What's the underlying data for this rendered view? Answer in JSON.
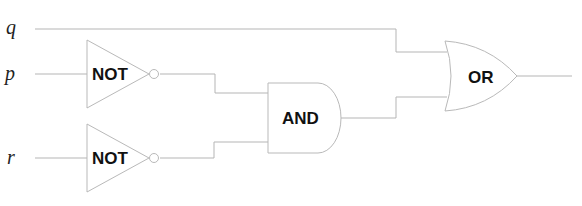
{
  "diagram": {
    "type": "logic-circuit",
    "inputs": [
      {
        "id": "q",
        "label": "q"
      },
      {
        "id": "p",
        "label": "p"
      },
      {
        "id": "r",
        "label": "r"
      }
    ],
    "gates": [
      {
        "id": "not1",
        "label": "NOT",
        "input": "p"
      },
      {
        "id": "not2",
        "label": "NOT",
        "input": "r"
      },
      {
        "id": "and1",
        "label": "AND",
        "inputs": [
          "not1",
          "not2"
        ]
      },
      {
        "id": "or1",
        "label": "OR",
        "inputs": [
          "q",
          "and1"
        ]
      }
    ],
    "colors": {
      "wire": "#b5b5b5",
      "text": "#111111"
    }
  }
}
